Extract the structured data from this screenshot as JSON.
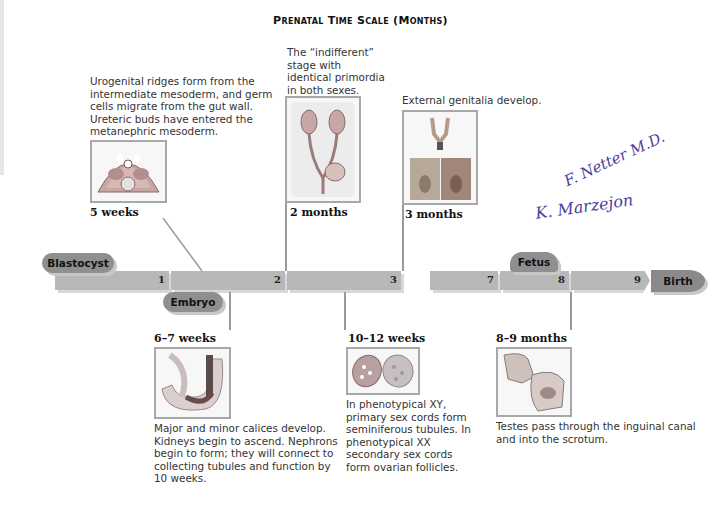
{
  "title": "Prenatal Time Scale (Months)",
  "timeline": {
    "segments": [
      {
        "number": "1"
      },
      {
        "number": "2"
      },
      {
        "number": "3"
      },
      {
        "number": "7"
      },
      {
        "number": "8"
      },
      {
        "number": "9"
      }
    ],
    "labels": {
      "blastocyst": "Blastocyst",
      "embryo": "Embryo",
      "fetus": "Fetus",
      "birth": "Birth"
    },
    "colors": {
      "bar": "#b8b8b8",
      "pill": "#8f8f8f",
      "frame": "#a8a8a8"
    }
  },
  "stages_above": [
    {
      "stage": "5 weeks",
      "description": "Urogenital ridges form from the intermediate mesoderm, and germ cells migrate from the gut wall. Ureteric buds have entered the metanephric mesoderm.",
      "image": "embryo-cross-section-illustration"
    },
    {
      "stage": "2 months",
      "description": "The “indifferent” stage with identical primordia in both sexes.",
      "image": "indifferent-gonads-illustration"
    },
    {
      "stage": "3 months",
      "description": "External genitalia develop.",
      "image": "external-genitalia-illustration"
    }
  ],
  "stages_below": [
    {
      "stage": "6–7 weeks",
      "description": "Major and minor calices develop. Kidneys begin to ascend. Nephrons begin to form; they will connect to collecting tubules and function by 10 weeks.",
      "image": "kidney-calices-illustration"
    },
    {
      "stage": "10–12 weeks",
      "description": "In phenotypical XY, primary sex cords form seminiferous tubules. In phenotypical XX secondary sex cords form ovarian follicles.",
      "image": "testis-ovary-illustration"
    },
    {
      "stage": "8–9 months",
      "description": "Testes pass through the inguinal canal and into the scrotum.",
      "image": "testicular-descent-illustration"
    }
  ],
  "signatures": [
    "F. Netter M.D.",
    "K. Marzejon"
  ]
}
